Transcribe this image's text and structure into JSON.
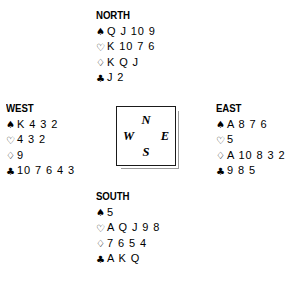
{
  "diagram": {
    "type": "bridge-deal",
    "suit_symbols": {
      "spade": "♠",
      "heart": "♡",
      "diamond": "♢",
      "club": "♣"
    },
    "compass": {
      "north": "N",
      "south": "S",
      "west": "W",
      "east": "E"
    },
    "hands": {
      "north": {
        "label": "NORTH",
        "spades": "Q J 10 9",
        "hearts": "K 10 7 6",
        "diamonds": "K Q J",
        "clubs": "J 2"
      },
      "west": {
        "label": "WEST",
        "spades": "K 4 3 2",
        "hearts": "4 3 2",
        "diamonds": "9",
        "clubs": "10 7 6 4 3"
      },
      "east": {
        "label": "EAST",
        "spades": "A 8 7 6",
        "hearts": "5",
        "diamonds": "A 10 8 3 2",
        "clubs": "9 8 5"
      },
      "south": {
        "label": "SOUTH",
        "spades": "5",
        "hearts": "A Q J 9 8",
        "diamonds": "7 6 5 4",
        "clubs": "A K Q"
      }
    }
  }
}
